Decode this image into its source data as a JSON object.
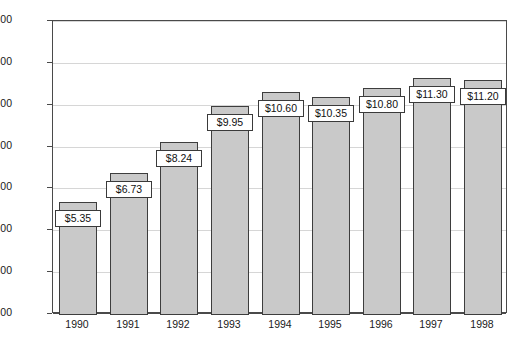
{
  "chart_data": {
    "type": "bar",
    "title": "",
    "xlabel": "",
    "ylabel": "",
    "categories": [
      "1990",
      "1991",
      "1992",
      "1993",
      "1994",
      "1995",
      "1996",
      "1997",
      "1998"
    ],
    "values": [
      5.35,
      6.73,
      8.24,
      9.95,
      10.6,
      10.35,
      10.8,
      11.3,
      11.2
    ],
    "data_labels": [
      "$5.35",
      "$6.73",
      "$8.24",
      "$9.95",
      "$10.60",
      "$10.35",
      "$10.80",
      "$11.30",
      "$11.20"
    ],
    "ylim": [
      0,
      14
    ],
    "ytick_values": [
      0,
      2,
      4,
      6,
      8,
      10,
      12,
      14
    ],
    "ytick_labels": [
      "$0.00",
      "$2.00",
      "$4.00",
      "$6.00",
      "$8.00",
      "$10.00",
      "$12.00",
      "$14.00"
    ],
    "grid": true,
    "legend": "none",
    "bar_color": "#c9c9c9",
    "bar_border_color": "#3d3d3d",
    "gridline_color": "#d6d6d6",
    "axis_color": "#4a4a4a",
    "label_box_color": "#ffffff"
  }
}
